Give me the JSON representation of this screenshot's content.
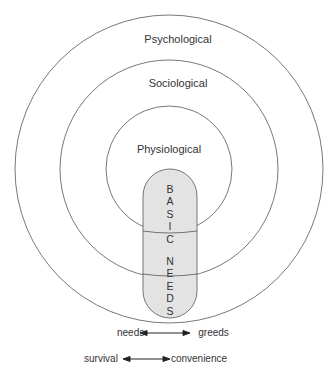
{
  "diagram": {
    "rings": [
      {
        "name": "outer",
        "label": "Psychological",
        "cx": 169,
        "cy": 169,
        "r": 154
      },
      {
        "name": "middle",
        "label": "Sociological",
        "cx": 169,
        "cy": 169,
        "r": 109
      },
      {
        "name": "inner",
        "label": "Physiological",
        "cx": 169,
        "cy": 169,
        "r": 63
      }
    ],
    "core": {
      "letters": [
        "B",
        "A",
        "S",
        "I",
        "C",
        "",
        "N",
        "E",
        "E",
        "D",
        "S"
      ],
      "label": "BASIC NEEDS",
      "fill": "#e3e3e3"
    },
    "spectrums": [
      {
        "left": "needs",
        "right": "greeds"
      },
      {
        "left": "survival",
        "right": "convenience"
      }
    ],
    "stroke_color": "#555555"
  }
}
